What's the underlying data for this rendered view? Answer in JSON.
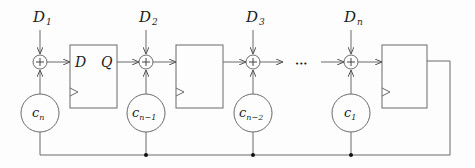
{
  "diagram": {
    "type": "linear feedback shift register with input adders",
    "inputs": [
      {
        "base": "D",
        "sub": "1"
      },
      {
        "base": "D",
        "sub": "2"
      },
      {
        "base": "D",
        "sub": "3"
      },
      {
        "base": "D",
        "sub": "n"
      }
    ],
    "adder_symbol": "+",
    "register": {
      "d_label": "D",
      "q_label": "Q"
    },
    "coefficients": [
      {
        "base": "c",
        "sub": "n"
      },
      {
        "base": "c",
        "sub": "n−1"
      },
      {
        "base": "c",
        "sub": "n−2"
      },
      {
        "base": "c",
        "sub": "1"
      }
    ],
    "ellipsis": "•••",
    "colors": {
      "line": "#6a6a6a",
      "text": "#1a1a1a",
      "dot": "#111111"
    }
  }
}
